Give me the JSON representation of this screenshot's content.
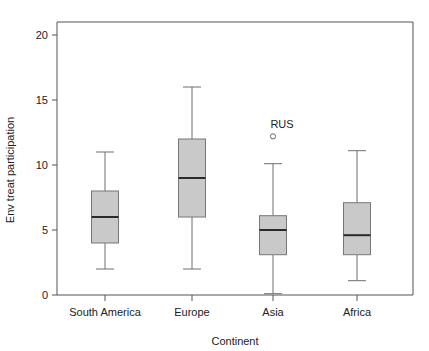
{
  "chart_data": {
    "type": "box",
    "title": "",
    "xlabel": "Continent",
    "ylabel": "Env treat participation",
    "categories": [
      "South America",
      "Europe",
      "Asia",
      "Africa"
    ],
    "ylim": [
      0,
      21
    ],
    "yticks": [
      0,
      5,
      10,
      15,
      20
    ],
    "ytick_labels": [
      "0",
      "5",
      "10",
      "15",
      "20"
    ],
    "grid": false,
    "legend": "none",
    "boxes": [
      {
        "category": "South America",
        "whisker_low": 2.0,
        "q1": 4.0,
        "median": 6.0,
        "q3": 8.0,
        "whisker_high": 11.0,
        "outliers": []
      },
      {
        "category": "Europe",
        "whisker_low": 2.0,
        "q1": 6.0,
        "median": 9.0,
        "q3": 12.0,
        "whisker_high": 16.0,
        "outliers": []
      },
      {
        "category": "Asia",
        "whisker_low": 0.1,
        "q1": 3.1,
        "median": 5.0,
        "q3": 6.1,
        "whisker_high": 10.1,
        "outliers": [
          {
            "label": "RUS",
            "value": 12.2
          }
        ]
      },
      {
        "category": "Africa",
        "whisker_low": 1.1,
        "q1": 3.1,
        "median": 4.6,
        "q3": 7.1,
        "whisker_high": 11.1,
        "outliers": []
      }
    ],
    "colors": {
      "box_fill": "#c9c9c9",
      "box_stroke": "#777777",
      "median": "#2a2a2a",
      "whisker": "#6e6e6e",
      "axis": "#555555",
      "text": "#222222",
      "background": "#ffffff"
    }
  }
}
